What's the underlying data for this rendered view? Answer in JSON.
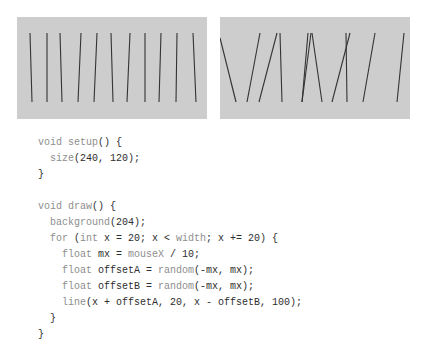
{
  "figures": {
    "background_color": "#cdcdcd",
    "stroke_color": "#333333",
    "panels": [
      {
        "name": "low-randomness-output",
        "lines": [
          [
            13,
            16,
            15,
            85
          ],
          [
            30,
            16,
            30,
            85
          ],
          [
            43,
            16,
            45,
            85
          ],
          [
            64,
            16,
            61,
            85
          ],
          [
            80,
            16,
            77,
            85
          ],
          [
            94,
            16,
            96,
            85
          ],
          [
            113,
            16,
            110,
            85
          ],
          [
            128,
            16,
            128,
            85
          ],
          [
            144,
            16,
            142,
            85
          ],
          [
            160,
            16,
            159,
            85
          ],
          [
            176,
            16,
            179,
            85
          ]
        ]
      },
      {
        "name": "high-randomness-output",
        "lines": [
          [
            0,
            21,
            16,
            85
          ],
          [
            40,
            16,
            27,
            85
          ],
          [
            57,
            16,
            39,
            85
          ],
          [
            60,
            16,
            62,
            85
          ],
          [
            88,
            16,
            82,
            85
          ],
          [
            91,
            16,
            82,
            85
          ],
          [
            92,
            16,
            102,
            85
          ],
          [
            130,
            16,
            112,
            85
          ],
          [
            126,
            16,
            127,
            85
          ],
          [
            155,
            16,
            143,
            85
          ],
          [
            184,
            16,
            177,
            85
          ]
        ]
      }
    ]
  },
  "code": {
    "language": "Processing",
    "lines": [
      [
        [
          "kw",
          "void"
        ],
        [
          "tx",
          " "
        ],
        [
          "kw",
          "setup"
        ],
        [
          "tx",
          "() {"
        ]
      ],
      [
        [
          "tx",
          "  "
        ],
        [
          "kw",
          "size"
        ],
        [
          "tx",
          "(240, 120);"
        ]
      ],
      [
        [
          "tx",
          "}"
        ]
      ],
      [
        [
          "tx",
          ""
        ]
      ],
      [
        [
          "kw",
          "void"
        ],
        [
          "tx",
          " "
        ],
        [
          "kw",
          "draw"
        ],
        [
          "tx",
          "() {"
        ]
      ],
      [
        [
          "tx",
          "  "
        ],
        [
          "kw",
          "background"
        ],
        [
          "tx",
          "(204);"
        ]
      ],
      [
        [
          "tx",
          "  "
        ],
        [
          "kw",
          "for"
        ],
        [
          "tx",
          " ("
        ],
        [
          "kw",
          "int"
        ],
        [
          "tx",
          " x = 20; x < "
        ],
        [
          "kw",
          "width"
        ],
        [
          "tx",
          "; x += 20) {"
        ]
      ],
      [
        [
          "tx",
          "    "
        ],
        [
          "kw",
          "float"
        ],
        [
          "tx",
          " mx = "
        ],
        [
          "kw",
          "mouseX"
        ],
        [
          "tx",
          " / 10;"
        ]
      ],
      [
        [
          "tx",
          "    "
        ],
        [
          "kw",
          "float"
        ],
        [
          "tx",
          " offsetA = "
        ],
        [
          "kw",
          "random"
        ],
        [
          "tx",
          "(-mx, mx);"
        ]
      ],
      [
        [
          "tx",
          "    "
        ],
        [
          "kw",
          "float"
        ],
        [
          "tx",
          " offsetB = "
        ],
        [
          "kw",
          "random"
        ],
        [
          "tx",
          "(-mx, mx);"
        ]
      ],
      [
        [
          "tx",
          "    "
        ],
        [
          "kw",
          "line"
        ],
        [
          "tx",
          "(x + offsetA, 20, x - offsetB, 100);"
        ]
      ],
      [
        [
          "tx",
          "  }"
        ]
      ],
      [
        [
          "tx",
          "}"
        ]
      ]
    ]
  }
}
